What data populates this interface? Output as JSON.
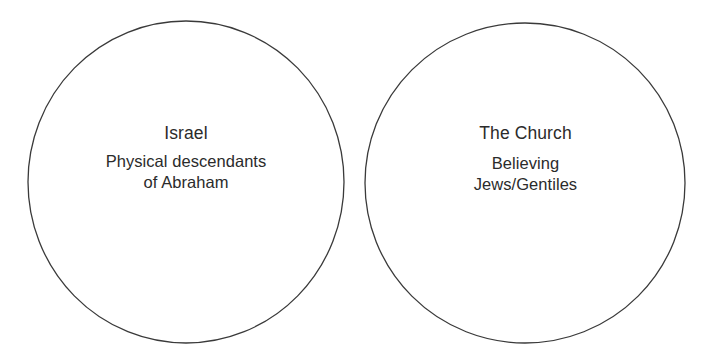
{
  "canvas": {
    "width": 716,
    "height": 358,
    "background_color": "#ffffff"
  },
  "diagram": {
    "type": "two-separate-circles",
    "stroke_color": "#3a3a3a",
    "text_color": "#2b2b2b",
    "shapes": [
      {
        "name": "israel-circle",
        "cx": 186,
        "cy": 182,
        "rx": 158,
        "ry": 161
      },
      {
        "name": "church-circle",
        "cx": 525,
        "cy": 183,
        "rx": 160,
        "ry": 160
      }
    ]
  },
  "israel": {
    "title": "Israel",
    "line1": "Physical descendants",
    "line2": "of Abraham"
  },
  "church": {
    "title": "The Church",
    "line1": "Believing",
    "line2": "Jews/Gentiles"
  }
}
